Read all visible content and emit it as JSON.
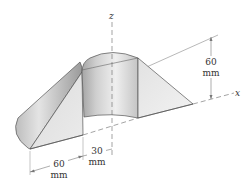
{
  "diagram": {
    "type": "isometric-solid",
    "axes": {
      "z": "z",
      "x": "x"
    },
    "dimensions": {
      "height": {
        "value": "60",
        "unit": "mm"
      },
      "left_length": {
        "value": "60",
        "unit": "mm"
      },
      "radius": {
        "value": "30",
        "unit": "mm"
      }
    },
    "colors": {
      "outline": "#555555",
      "surface_light": "#eeeeee",
      "surface_mid": "#d6d6d6",
      "surface_dark": "#a8a8a8",
      "dim_line": "#777777"
    }
  }
}
